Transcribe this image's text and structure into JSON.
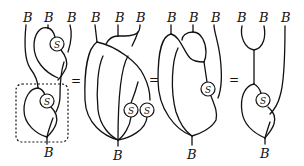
{
  "figure": {
    "object_label": "B",
    "antipode_label": "S",
    "equals_symbol": "=",
    "colors": {
      "ink": "#111111",
      "background": "#ffffff"
    },
    "diagrams": [
      {
        "id": "lhs",
        "inputs": [
          "B",
          "B",
          "B"
        ],
        "output": "B",
        "antipode_nodes": [
          "S",
          "S"
        ],
        "highlighted_region": "dashed box around lower block"
      },
      {
        "id": "step2",
        "inputs": [
          "B",
          "B",
          "B"
        ],
        "output": "B",
        "antipode_nodes": [
          "S",
          "S"
        ]
      },
      {
        "id": "step3",
        "inputs": [
          "B",
          "B",
          "B"
        ],
        "output": "B",
        "antipode_nodes": [
          "S"
        ]
      },
      {
        "id": "rhs",
        "inputs": [
          "B",
          "B",
          "B"
        ],
        "output": "B",
        "antipode_nodes": [
          "S"
        ]
      }
    ]
  }
}
